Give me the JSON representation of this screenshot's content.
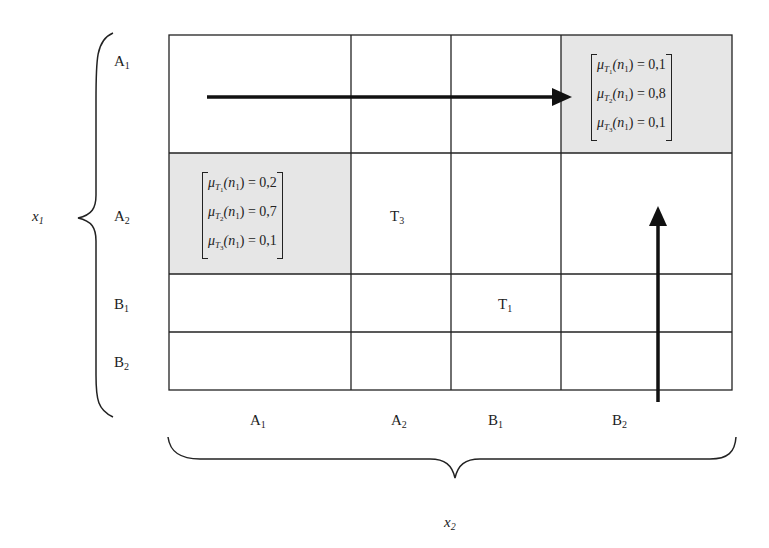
{
  "axes": {
    "x1": {
      "name": "x",
      "sub": "1"
    },
    "x2": {
      "name": "x",
      "sub": "2"
    }
  },
  "rows": [
    {
      "letter": "A",
      "sub": "1"
    },
    {
      "letter": "A",
      "sub": "2"
    },
    {
      "letter": "B",
      "sub": "1"
    },
    {
      "letter": "B",
      "sub": "2"
    }
  ],
  "cols": [
    {
      "letter": "A",
      "sub": "1"
    },
    {
      "letter": "A",
      "sub": "2"
    },
    {
      "letter": "B",
      "sub": "1"
    },
    {
      "letter": "B",
      "sub": "2"
    }
  ],
  "cell_labels": {
    "t3": {
      "letter": "T",
      "sub": "3"
    },
    "t1": {
      "letter": "T",
      "sub": "1"
    }
  },
  "membership_top_right": {
    "cell": "A1,B2",
    "rows": [
      {
        "mu": "μ",
        "T": "T",
        "Tsub": "1",
        "arg": "(n",
        "argsub": "1",
        "eq": ") = 0,1"
      },
      {
        "mu": "μ",
        "T": "T",
        "Tsub": "2",
        "arg": "(n",
        "argsub": "1",
        "eq": ") = 0,8"
      },
      {
        "mu": "μ",
        "T": "T",
        "Tsub": "3",
        "arg": "(n",
        "argsub": "1",
        "eq": ") = 0,1"
      }
    ]
  },
  "membership_left": {
    "cell": "A2,A1",
    "rows": [
      {
        "mu": "μ",
        "T": "T",
        "Tsub": "1",
        "arg": "(n",
        "argsub": "1",
        "eq": ") = 0,2"
      },
      {
        "mu": "μ",
        "T": "T",
        "Tsub": "2",
        "arg": "(n",
        "argsub": "1",
        "eq": ") = 0,7"
      },
      {
        "mu": "μ",
        "T": "T",
        "Tsub": "3",
        "arg": "(n",
        "argsub": "1",
        "eq": ") = 0,1"
      }
    ]
  },
  "colors": {
    "shade": "#e6e6e6",
    "line": "#222222"
  }
}
